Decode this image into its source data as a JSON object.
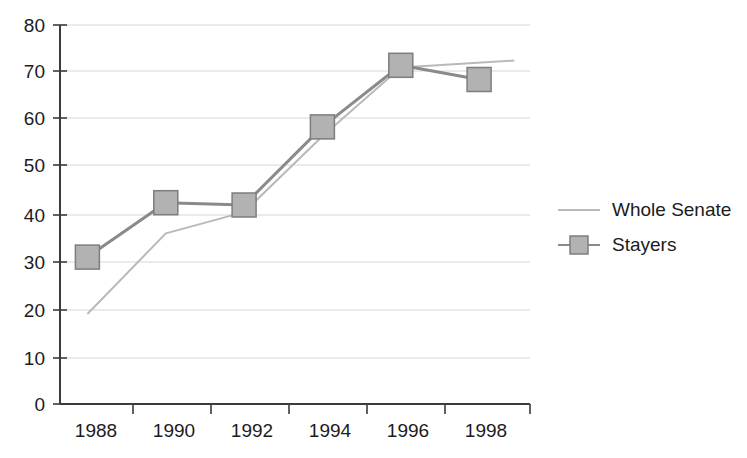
{
  "chart_data": {
    "type": "line",
    "title": "",
    "subtitle": "",
    "xlabel": "",
    "ylabel": "",
    "x": [
      1988,
      1990,
      1992,
      1994,
      1996,
      1998
    ],
    "categories": [
      "1988",
      "1990",
      "1992",
      "1994",
      "1996",
      "1998"
    ],
    "xtick_labels": [
      "1988",
      "1990",
      "1992",
      "1994",
      "1996",
      "1998"
    ],
    "ytick_labels": [
      "0",
      "10",
      "20",
      "30",
      "40",
      "50",
      "60",
      "70",
      "80"
    ],
    "yticks": [
      0,
      10,
      20,
      30,
      40,
      50,
      60,
      70,
      80
    ],
    "ylim": [
      0,
      80
    ],
    "xlim": [
      1987.3,
      1999.3
    ],
    "grid": "horizontal",
    "legend_position": "right",
    "series": [
      {
        "name": "Whole Senate",
        "marker": "none",
        "color": "#b9b9b9",
        "x": [
          1988.0,
          1990.0,
          1992.0,
          1994.0,
          1996.0,
          1998.9
        ],
        "values": [
          19,
          36,
          40.5,
          56.5,
          71,
          72.5
        ]
      },
      {
        "name": "Stayers",
        "marker": "square",
        "color": "#8a8a8a",
        "x": [
          1988,
          1990,
          1992,
          1994,
          1996,
          1998
        ],
        "values": [
          31,
          42.5,
          42,
          58.5,
          71.5,
          68.5
        ]
      }
    ]
  },
  "legend": {
    "items": [
      {
        "label": "Whole Senate",
        "marker": "none",
        "color": "#b9b9b9"
      },
      {
        "label": "Stayers",
        "marker": "square",
        "color": "#8a8a8a"
      }
    ]
  },
  "axes": {
    "y_label_0": "0",
    "y_label_10": "10",
    "y_label_20": "20",
    "y_label_30": "30",
    "y_label_40": "40",
    "y_label_50": "50",
    "y_label_60": "60",
    "y_label_70": "70",
    "y_label_80": "80",
    "x_label_1988": "1988",
    "x_label_1990": "1990",
    "x_label_1992": "1992",
    "x_label_1994": "1994",
    "x_label_1996": "1996",
    "x_label_1998": "1998"
  },
  "colors": {
    "axis": "#3b3b3b",
    "grid": "#d6d6d6",
    "series_whole_senate": "#b9b9b9",
    "series_stayers": "#8a8a8a",
    "marker_fill": "#b2b2b2",
    "marker_stroke": "#7d7d7d",
    "text": "#1c1c1c",
    "background": "#ffffff"
  }
}
